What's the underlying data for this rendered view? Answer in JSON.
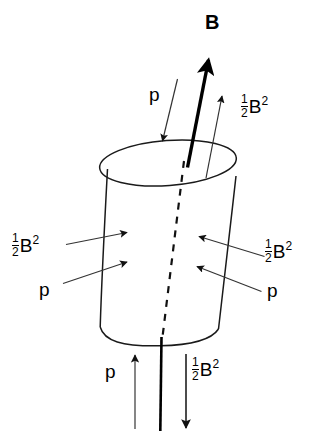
{
  "figure": {
    "type": "physics-diagram",
    "background_color": "#ffffff",
    "line_color": "#000000"
  },
  "labels": {
    "field_label": "B",
    "pressure_symbol": "p",
    "magnetic_pressure": {
      "numerator": "1",
      "denominator": "2",
      "base": "B",
      "exponent": "2"
    }
  },
  "annotations": [
    {
      "id": "b-field",
      "text": "B",
      "kind": "bold-vector",
      "x": 206,
      "y": 13
    },
    {
      "id": "top-pressure",
      "text": "p",
      "kind": "scalar",
      "x": 150,
      "y": 86
    },
    {
      "id": "top-right-magnetic",
      "text": "1/2 B^2",
      "kind": "fraction-expr",
      "x": 242,
      "y": 95
    },
    {
      "id": "left-magnetic",
      "text": "1/2 B^2",
      "kind": "fraction-expr",
      "x": 13,
      "y": 234
    },
    {
      "id": "left-pressure",
      "text": "p",
      "kind": "scalar",
      "x": 40,
      "y": 281
    },
    {
      "id": "right-magnetic",
      "text": "1/2 B^2",
      "kind": "fraction-expr",
      "x": 266,
      "y": 240
    },
    {
      "id": "right-pressure",
      "text": "p",
      "kind": "scalar",
      "x": 268,
      "y": 282
    },
    {
      "id": "bottom-pressure",
      "text": "p",
      "kind": "scalar",
      "x": 106,
      "y": 363
    },
    {
      "id": "bottom-magnetic",
      "text": "1/2 B^2",
      "kind": "fraction-expr",
      "x": 193,
      "y": 358
    }
  ],
  "arrows": [
    {
      "id": "b-field-arrow",
      "style": "bold",
      "direction": "up-right",
      "from": [
        188,
        167
      ],
      "to": [
        209,
        58
      ]
    },
    {
      "id": "top-pressure-arrow",
      "style": "thin",
      "direction": "down-left",
      "from": [
        177,
        79
      ],
      "to": [
        162,
        143
      ]
    },
    {
      "id": "top-magnetic-arrow",
      "style": "thin",
      "direction": "up-right",
      "from": [
        206,
        177
      ],
      "to": [
        222,
        94
      ]
    },
    {
      "id": "left-magnetic-arrow",
      "style": "thin",
      "direction": "right",
      "from": [
        66,
        244
      ],
      "to": [
        127,
        232
      ]
    },
    {
      "id": "left-pressure-arrow",
      "style": "thin",
      "direction": "right",
      "from": [
        63,
        283
      ],
      "to": [
        127,
        262
      ]
    },
    {
      "id": "right-magnetic-arrow",
      "style": "thin",
      "direction": "left",
      "from": [
        264,
        256
      ],
      "to": [
        199,
        236
      ]
    },
    {
      "id": "right-pressure-arrow",
      "style": "thin",
      "direction": "left",
      "from": [
        261,
        291
      ],
      "to": [
        197,
        266
      ]
    },
    {
      "id": "bottom-pressure-arrow",
      "style": "thin",
      "direction": "up",
      "from": [
        135,
        428
      ],
      "to": [
        135,
        356
      ]
    },
    {
      "id": "bottom-magnetic-arrow",
      "style": "thin",
      "direction": "down",
      "from": [
        186,
        356
      ],
      "to": [
        186,
        428
      ]
    }
  ],
  "shapes": {
    "cylinder": {
      "top_ellipse": {
        "cx": 168,
        "cy": 163,
        "rx": 68,
        "ry": 22,
        "rotation_deg": -4
      },
      "left_wall": {
        "from": [
          107,
          170
        ],
        "to": [
          100,
          327
        ]
      },
      "right_wall": {
        "from": [
          236,
          176
        ],
        "to": [
          218,
          329
        ]
      },
      "bottom_arc": {
        "from": [
          100,
          327
        ],
        "to": [
          218,
          329
        ],
        "sag": 17
      }
    },
    "axis_dashed": {
      "from": [
        184,
        160
      ],
      "to": [
        162,
        341
      ],
      "dash": "6 6"
    },
    "axis_solid": {
      "from": [
        161,
        340
      ],
      "to": [
        160,
        430
      ],
      "width": 2.6
    }
  }
}
